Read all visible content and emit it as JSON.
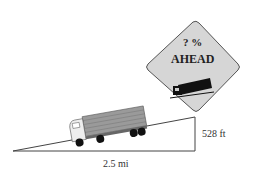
{
  "sign": {
    "line1": "? %",
    "line2": "AHEAD",
    "icon": "truck-on-slope-icon",
    "fill": "#d9d9d9"
  },
  "diagram": {
    "horizontal_label": "2.5 mi",
    "vertical_label": "528 ft",
    "vehicle": "truck-icon"
  }
}
